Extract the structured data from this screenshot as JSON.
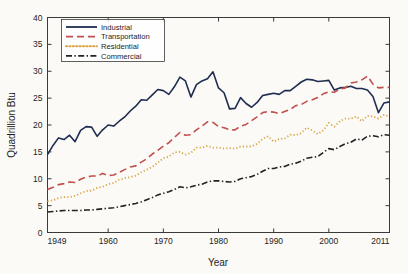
{
  "chart_data": {
    "type": "line",
    "title": "",
    "xlabel": "Year",
    "ylabel": "Quadrillion Btu",
    "xlim": [
      1949,
      2011
    ],
    "ylim": [
      0,
      40
    ],
    "grid": false,
    "legend_position": "top-left",
    "xticks": [
      1949,
      1960,
      1970,
      1980,
      1990,
      2000,
      2011
    ],
    "xticklabels": [
      "1949",
      "1960",
      "1970",
      "1980",
      "1990",
      "2000",
      "2011"
    ],
    "yticks": [
      0,
      5,
      10,
      15,
      20,
      25,
      30,
      35,
      40
    ],
    "yticklabels": [
      "0",
      "5",
      "10",
      "15",
      "20",
      "25",
      "30",
      "35",
      "40"
    ],
    "x": [
      1949,
      1950,
      1951,
      1952,
      1953,
      1954,
      1955,
      1956,
      1957,
      1958,
      1959,
      1960,
      1961,
      1962,
      1963,
      1964,
      1965,
      1966,
      1967,
      1968,
      1969,
      1970,
      1971,
      1972,
      1973,
      1974,
      1975,
      1976,
      1977,
      1978,
      1979,
      1980,
      1981,
      1982,
      1983,
      1984,
      1985,
      1986,
      1987,
      1988,
      1989,
      1990,
      1991,
      1992,
      1993,
      1994,
      1995,
      1996,
      1997,
      1998,
      1999,
      2000,
      2001,
      2002,
      2003,
      2004,
      2005,
      2006,
      2007,
      2008,
      2009,
      2010,
      2011
    ],
    "series": [
      {
        "name": "Industrial",
        "color": "#1f2d50",
        "style": "solid",
        "values": [
          14.5,
          16.2,
          17.6,
          17.3,
          18.1,
          16.9,
          19.0,
          19.7,
          19.6,
          17.9,
          19.1,
          20.0,
          19.8,
          20.7,
          21.5,
          22.6,
          23.5,
          24.7,
          24.6,
          25.6,
          26.6,
          26.4,
          25.7,
          27.1,
          28.9,
          28.2,
          25.2,
          27.5,
          28.2,
          28.6,
          29.9,
          26.9,
          26.0,
          23.0,
          23.1,
          25.1,
          24.0,
          23.3,
          24.2,
          25.5,
          25.7,
          25.9,
          25.7,
          26.4,
          26.4,
          27.2,
          28.0,
          28.5,
          28.4,
          28.1,
          28.2,
          28.3,
          26.5,
          26.9,
          27.0,
          27.2,
          26.8,
          26.8,
          26.5,
          25.3,
          22.3,
          24.1,
          24.3
        ]
      },
      {
        "name": "Transportation",
        "color": "#c0504d",
        "style": "dashed",
        "values": [
          8.0,
          8.4,
          8.9,
          9.1,
          9.4,
          9.3,
          9.9,
          10.3,
          10.5,
          10.5,
          11.0,
          10.6,
          10.7,
          11.2,
          11.7,
          12.2,
          12.4,
          13.1,
          13.7,
          14.6,
          15.3,
          16.1,
          16.7,
          17.7,
          18.6,
          18.1,
          18.2,
          19.1,
          19.8,
          20.6,
          20.5,
          19.7,
          19.5,
          19.1,
          19.1,
          19.8,
          20.1,
          20.8,
          21.5,
          22.3,
          22.5,
          22.4,
          22.1,
          22.5,
          22.9,
          23.6,
          23.8,
          24.4,
          24.7,
          25.1,
          25.8,
          26.2,
          26.1,
          26.7,
          26.9,
          27.8,
          28.0,
          28.4,
          29.1,
          27.6,
          26.9,
          27.0,
          27.0
        ]
      },
      {
        "name": "Residential",
        "color": "#d9a441",
        "style": "dotted",
        "values": [
          5.8,
          6.0,
          6.4,
          6.6,
          6.6,
          6.8,
          7.3,
          7.7,
          7.8,
          8.3,
          8.5,
          9.0,
          9.2,
          9.8,
          10.1,
          10.3,
          10.6,
          11.2,
          11.7,
          12.2,
          13.0,
          13.8,
          14.1,
          14.9,
          15.0,
          14.5,
          14.8,
          15.8,
          15.8,
          16.1,
          15.8,
          15.8,
          15.6,
          15.7,
          15.6,
          16.0,
          16.0,
          16.0,
          16.5,
          17.4,
          17.9,
          16.9,
          17.4,
          17.5,
          18.2,
          18.1,
          18.5,
          19.5,
          19.0,
          18.3,
          19.0,
          20.4,
          19.7,
          20.7,
          21.2,
          21.2,
          21.6,
          20.7,
          21.7,
          21.6,
          21.2,
          21.9,
          21.6
        ]
      },
      {
        "name": "Commercial",
        "color": "#232323",
        "style": "dashdot",
        "values": [
          3.8,
          3.9,
          4.0,
          4.1,
          4.1,
          4.1,
          4.1,
          4.2,
          4.2,
          4.3,
          4.4,
          4.5,
          4.6,
          4.8,
          5.0,
          5.2,
          5.4,
          5.7,
          6.1,
          6.5,
          7.0,
          7.3,
          7.6,
          8.0,
          8.5,
          8.3,
          8.5,
          8.8,
          9.0,
          9.4,
          9.6,
          9.6,
          9.5,
          9.4,
          9.5,
          10.0,
          10.2,
          10.4,
          10.8,
          11.4,
          11.9,
          11.9,
          12.2,
          12.3,
          12.7,
          12.9,
          13.3,
          13.8,
          14.0,
          14.1,
          14.9,
          15.6,
          15.4,
          16.0,
          16.5,
          16.8,
          17.4,
          17.2,
          17.9,
          18.0,
          17.8,
          18.2,
          18.1
        ]
      }
    ]
  },
  "legend": {
    "entries": [
      {
        "label": "Industrial"
      },
      {
        "label": "Transportation"
      },
      {
        "label": "Residential"
      },
      {
        "label": "Commercial"
      }
    ]
  }
}
